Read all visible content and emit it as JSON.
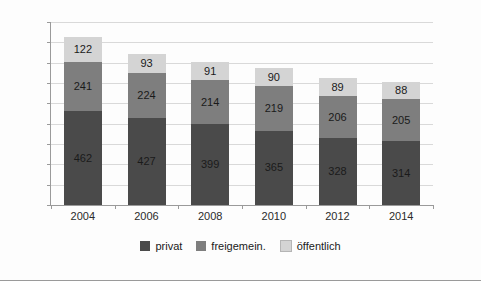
{
  "chart_data": {
    "type": "bar",
    "subtype": "stacked-vertical",
    "title": "",
    "subtitle": "",
    "xlabel": "",
    "ylabel": "",
    "categories": [
      "2004",
      "2006",
      "2008",
      "2010",
      "2012",
      "2014"
    ],
    "series": [
      {
        "name": "privat",
        "values": [
          462,
          427,
          399,
          365,
          328,
          314
        ],
        "color": "#4a4a4a"
      },
      {
        "name": "freigemein.",
        "values": [
          241,
          224,
          214,
          219,
          206,
          205
        ],
        "color": "#7e7e7e"
      },
      {
        "name": "öffentlich",
        "values": [
          122,
          93,
          91,
          90,
          89,
          88
        ],
        "color": "#d4d4d4"
      }
    ],
    "totals": [
      825,
      744,
      704,
      674,
      623,
      607
    ],
    "ylim": [
      0,
      900
    ],
    "ytick_values": [
      0,
      100,
      200,
      300,
      400,
      500,
      600,
      700,
      800,
      900
    ],
    "ytick_labels": [
      "0",
      "100",
      "200",
      "300",
      "400",
      "500",
      "600",
      "700",
      "800",
      "900"
    ],
    "grid": true,
    "grid_axis": "y",
    "legend_position": "bottom",
    "legend_entries": [
      "privat",
      "freigemein.",
      "öffentlich"
    ],
    "data_labels": true,
    "annotations": []
  },
  "colors": {
    "background": "#fdfdfd",
    "axis": "#9a9a9a",
    "gridline": "#d9d9d9",
    "text": "#1a1a1a",
    "tick_text": "#2b2b2b",
    "series_privat": "#4a4a4a",
    "series_freigemein": "#7e7e7e",
    "series_oeffentlich": "#d4d4d4"
  }
}
